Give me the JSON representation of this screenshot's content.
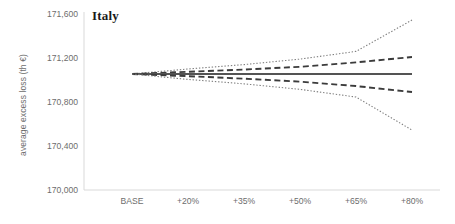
{
  "chart_data": {
    "type": "line",
    "title": "Italy",
    "xlabel": "",
    "ylabel": "average excess loss (th €)",
    "categories": [
      "BASE",
      "+20%",
      "+35%",
      "+50%",
      "+65%",
      "+80%"
    ],
    "x_positions": [
      132,
      188,
      244,
      300,
      356,
      412
    ],
    "ylim": [
      170000,
      171600
    ],
    "yticks": [
      170000,
      170400,
      170800,
      171200,
      171600
    ],
    "ytick_labels": [
      "170,000",
      "170,400",
      "170,800",
      "171,200",
      "171,600"
    ],
    "grid": false,
    "legend": "none",
    "series": [
      {
        "name": "upper outer band",
        "style": "dotted",
        "color": "#808080",
        "values": [
          171055,
          171100,
          171140,
          171190,
          171260,
          171545
        ]
      },
      {
        "name": "upper inner band",
        "style": "dashed",
        "color": "#3b3b3b",
        "values": [
          171055,
          171075,
          171095,
          171120,
          171160,
          171209
        ]
      },
      {
        "name": "mean",
        "style": "solid",
        "color": "#545454",
        "values": [
          171055,
          171055,
          171055,
          171055,
          171055,
          171055
        ]
      },
      {
        "name": "lower inner band",
        "style": "dashed",
        "color": "#3b3b3b",
        "values": [
          171055,
          171035,
          171012,
          170985,
          170945,
          170891
        ]
      },
      {
        "name": "lower outer band",
        "style": "dotted",
        "color": "#808080",
        "values": [
          171055,
          171005,
          170965,
          170915,
          170845,
          170545
        ]
      }
    ]
  },
  "axes": {
    "y_title": "average excess loss (th €)",
    "y_tick_labels": [
      "171,600",
      "171,200",
      "170,800",
      "170,400",
      "170,000"
    ],
    "x_tick_labels": [
      "BASE",
      "+20%",
      "+35%",
      "+50%",
      "+65%",
      "+80%"
    ]
  },
  "colors": {
    "axis": "#d9d9d9",
    "tick_text": "#6d6d6d",
    "title_text": "#1a1a1a",
    "mean_line": "#545454",
    "dashed_line": "#3b3b3b",
    "dotted_line": "#808080",
    "background": "#ffffff"
  }
}
